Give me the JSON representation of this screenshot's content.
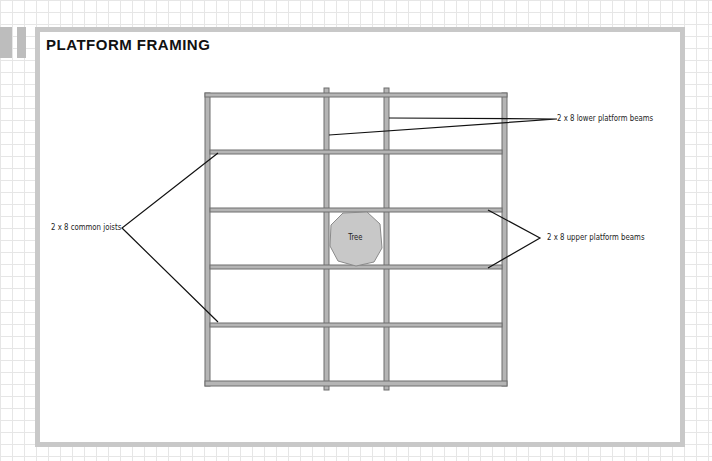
{
  "title": "PLATFORM FRAMING",
  "labels": {
    "lower_beams": "2 x 8 lower platform beams",
    "common_joists": "2 x 8 common joists",
    "upper_beams": "2 x 8 upper platform beams",
    "tree": "Tree"
  },
  "colors": {
    "lumber_fill": "#b5b5b5",
    "lumber_stroke": "#6e6e6e",
    "tree_fill": "#c8c8c8",
    "panel_border": "#c8c8c8",
    "grid_line": "#e6e6e6",
    "leader_line": "#111111"
  }
}
